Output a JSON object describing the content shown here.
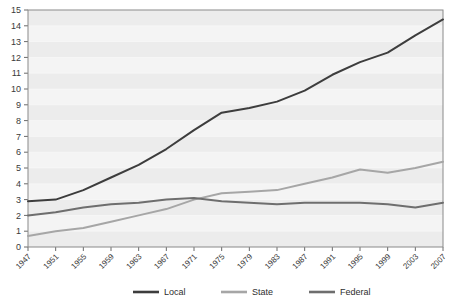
{
  "chart_data": {
    "type": "line",
    "title": "",
    "xlabel": "",
    "ylabel": "",
    "grid": true,
    "legend_position": "bottom",
    "xlim": [
      1947,
      2007
    ],
    "ylim": [
      0,
      15
    ],
    "ytick_labels": [
      "0",
      "1",
      "2",
      "3",
      "4",
      "5",
      "6",
      "7",
      "8",
      "9",
      "10",
      "11",
      "12",
      "13",
      "14",
      "15"
    ],
    "ytick_values": [
      0,
      1,
      2,
      3,
      4,
      5,
      6,
      7,
      8,
      9,
      10,
      11,
      12,
      13,
      14,
      15
    ],
    "xtick_labels": [
      "1947",
      "1951",
      "1955",
      "1959",
      "1963",
      "1967",
      "1971",
      "1975",
      "1979",
      "1983",
      "1987",
      "1991",
      "1995",
      "1999",
      "2003",
      "2007"
    ],
    "xtick_values": [
      1947,
      1951,
      1955,
      1959,
      1963,
      1967,
      1971,
      1975,
      1979,
      1983,
      1987,
      1991,
      1995,
      1999,
      2003,
      2007
    ],
    "x": [
      1947,
      1951,
      1955,
      1959,
      1963,
      1967,
      1971,
      1975,
      1979,
      1983,
      1987,
      1991,
      1995,
      1999,
      2003,
      2007
    ],
    "series": [
      {
        "name": "Local",
        "color": "#3d3d3d",
        "values": [
          2.9,
          3.0,
          3.6,
          4.4,
          5.2,
          6.2,
          7.4,
          8.5,
          8.8,
          9.2,
          9.9,
          10.9,
          11.7,
          12.3,
          13.4,
          14.4
        ]
      },
      {
        "name": "State",
        "color": "#a6a6a6",
        "values": [
          0.7,
          1.0,
          1.2,
          1.6,
          2.0,
          2.4,
          3.0,
          3.4,
          3.5,
          3.6,
          4.0,
          4.4,
          4.9,
          4.7,
          5.0,
          5.4
        ]
      },
      {
        "name": "Federal",
        "color": "#6e6e6e",
        "values": [
          2.0,
          2.2,
          2.5,
          2.7,
          2.8,
          3.0,
          3.1,
          2.9,
          2.8,
          2.7,
          2.8,
          2.8,
          2.8,
          2.7,
          2.5,
          2.8
        ]
      }
    ]
  },
  "legend": {
    "items": [
      {
        "label": "Local",
        "color": "#3d3d3d"
      },
      {
        "label": "State",
        "color": "#a6a6a6"
      },
      {
        "label": "Federal",
        "color": "#6e6e6e"
      }
    ]
  },
  "plot_area": {
    "background": "#f4f4f4",
    "band_color": "#ececec",
    "border_color": "#8a8a8a"
  }
}
